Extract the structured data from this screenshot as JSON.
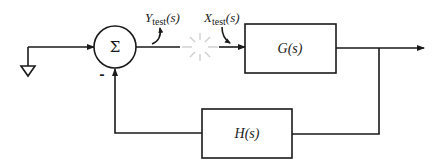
{
  "diagram": {
    "type": "feedback-control-block-diagram",
    "summing_junction": {
      "symbol": "Σ",
      "feedback_sign": "-"
    },
    "forward_block": {
      "label": "G(s)"
    },
    "feedback_block": {
      "label": "H(s)"
    },
    "test_signals": {
      "y_test": {
        "base": "Y",
        "sub": "test",
        "arg": "(s)"
      },
      "x_test": {
        "base": "X",
        "sub": "test",
        "arg": "(s)"
      }
    },
    "input": {
      "symbol": "ground-reference"
    },
    "loop_break": {
      "symbol": "starburst"
    }
  },
  "colors": {
    "line": "#1a1a1a",
    "break": "#cfcfcf",
    "background": "#ffffff"
  }
}
